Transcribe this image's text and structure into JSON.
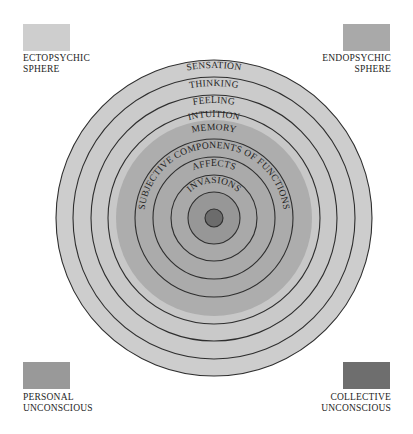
{
  "legend": {
    "ectopsychic": {
      "line1": "ECTOPSYCHIC",
      "line2": "SPHERE",
      "color": "#cecece"
    },
    "endopsychic": {
      "line1": "ENDOPSYCHIC",
      "line2": "SPHERE",
      "color": "#a9a9a9"
    },
    "personal": {
      "line1": "PERSONAL",
      "line2": "UNCONSCIOUS",
      "color": "#999999"
    },
    "collective": {
      "line1": "COLLECTIVE",
      "line2": "UNCONSCIOUS",
      "color": "#6e6e6e"
    }
  },
  "diagram": {
    "center": [
      214,
      218
    ],
    "rings": [
      {
        "label": "SENSATION",
        "outer_r": 158,
        "sphere": "ectopsychic"
      },
      {
        "label": "THINKING",
        "outer_r": 141,
        "sphere": "ectopsychic"
      },
      {
        "label": "FEELING",
        "outer_r": 123,
        "sphere": "ectopsychic"
      },
      {
        "label": "INTUITION",
        "outer_r": 106,
        "sphere": "ectopsychic"
      },
      {
        "label": "MEMORY",
        "outer_r": 98,
        "sphere": "endopsychic"
      },
      {
        "label": "SUBJECTIVE COMPONENTS OF FUNCTIONS",
        "outer_r": 79,
        "sphere": "endopsychic"
      },
      {
        "label": "AFFECTS",
        "outer_r": 61,
        "sphere": "endopsychic"
      },
      {
        "label": "INVASIONS",
        "outer_r": 43,
        "sphere": "endopsychic"
      },
      {
        "label": "",
        "outer_r": 26,
        "sphere": "personal"
      },
      {
        "label": "",
        "outer_r": 9,
        "sphere": "collective"
      }
    ]
  }
}
